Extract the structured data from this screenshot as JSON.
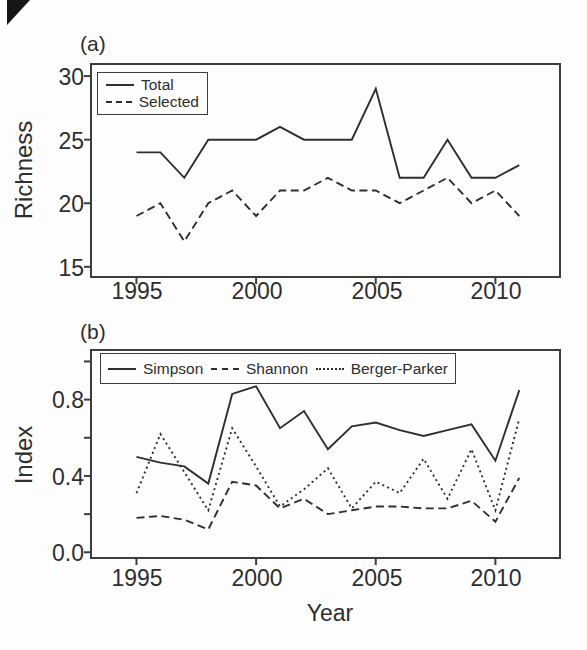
{
  "figure": {
    "panels": [
      {
        "tag": "(a)",
        "ylabel": "Richness",
        "xlabel": ""
      },
      {
        "tag": "(b)",
        "ylabel": "Index",
        "xlabel": "Year"
      }
    ]
  },
  "chart_data": [
    {
      "type": "line",
      "title": "(a)",
      "xlabel": "",
      "ylabel": "Richness",
      "x": [
        1995,
        1996,
        1997,
        1998,
        1999,
        2000,
        2001,
        2002,
        2003,
        2004,
        2005,
        2006,
        2007,
        2008,
        2009,
        2010,
        2011
      ],
      "series": [
        {
          "name": "Total",
          "style": "solid",
          "values": [
            24,
            24,
            22,
            25,
            25,
            25,
            26,
            25,
            25,
            25,
            29,
            22,
            22,
            25,
            22,
            22,
            23
          ]
        },
        {
          "name": "Selected",
          "style": "dashed",
          "values": [
            19,
            20,
            17,
            20,
            21,
            19,
            21,
            21,
            22,
            21,
            21,
            20,
            21,
            22,
            20,
            21,
            19
          ]
        }
      ],
      "xlim": [
        1993.1,
        2012.7
      ],
      "ylim": [
        14.2,
        30.95
      ],
      "xticks": [
        1995,
        2000,
        2005,
        2010
      ],
      "xtick_labels": [
        "1995",
        "2000",
        "2005",
        "2010"
      ],
      "yticks": [
        15,
        20,
        25,
        30
      ],
      "yticks_minor": [],
      "ytick_labels": [
        "15",
        "20",
        "25",
        "30"
      ],
      "grid": false,
      "legend_position": "top-left"
    },
    {
      "type": "line",
      "title": "(b)",
      "xlabel": "Year",
      "ylabel": "Index",
      "x": [
        1995,
        1996,
        1997,
        1998,
        1999,
        2000,
        2001,
        2002,
        2003,
        2004,
        2005,
        2006,
        2007,
        2008,
        2009,
        2010,
        2011
      ],
      "series": [
        {
          "name": "Simpson",
          "style": "solid",
          "values": [
            0.5,
            0.47,
            0.45,
            0.36,
            0.83,
            0.87,
            0.65,
            0.74,
            0.54,
            0.66,
            0.68,
            0.64,
            0.61,
            0.64,
            0.67,
            0.48,
            0.85
          ]
        },
        {
          "name": "Shannon",
          "style": "dashed",
          "values": [
            0.18,
            0.19,
            0.17,
            0.12,
            0.37,
            0.35,
            0.23,
            0.28,
            0.2,
            0.22,
            0.24,
            0.24,
            0.23,
            0.23,
            0.27,
            0.16,
            0.39
          ]
        },
        {
          "name": "Berger-Parker",
          "style": "dotted",
          "values": [
            0.31,
            0.62,
            0.42,
            0.22,
            0.65,
            0.45,
            0.24,
            0.33,
            0.44,
            0.23,
            0.37,
            0.31,
            0.49,
            0.28,
            0.54,
            0.22,
            0.7
          ]
        }
      ],
      "xlim": [
        1993.1,
        2012.7
      ],
      "ylim": [
        -0.03,
        1.06
      ],
      "xticks": [
        1995,
        2000,
        2005,
        2010
      ],
      "xtick_labels": [
        "1995",
        "2000",
        "2005",
        "2010"
      ],
      "yticks": [
        0.0,
        0.4,
        0.8
      ],
      "yticks_minor": [
        0.2,
        0.6,
        1.0
      ],
      "ytick_labels": [
        "0.0",
        "0.4",
        "0.8"
      ],
      "grid": false,
      "legend_position": "top"
    }
  ],
  "style_colors": {
    "line": "#2f2f2f",
    "frame": "#3d3d3d",
    "text": "#2e2e2e",
    "background": "#fdfdfd"
  }
}
